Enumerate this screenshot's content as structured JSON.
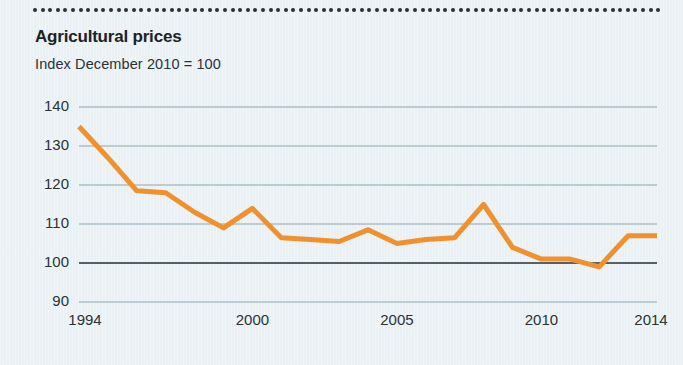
{
  "figure": {
    "title": "Agricultural prices",
    "subtitle": "Index December 2010 = 100",
    "background_color": "#e9f1f4",
    "accent_color": "#f0912d",
    "text_color": "#1c2226",
    "gridline_color": "#8fa3ad",
    "baseline_color": "#55626a",
    "rule_color": "#2a2f33"
  },
  "chart_data": {
    "type": "line",
    "title": "Agricultural prices",
    "subtitle": "Index December 2010 = 100",
    "xlabel": "",
    "ylabel": "",
    "xlim": [
      1994,
      2014
    ],
    "ylim": [
      90,
      140
    ],
    "yticks": [
      90,
      100,
      110,
      120,
      130,
      140
    ],
    "ytick_labels": [
      "90",
      "100",
      "110",
      "120",
      "130",
      "140"
    ],
    "xticks": [
      1994,
      2000,
      2005,
      2010,
      2014
    ],
    "xtick_labels": [
      "1994",
      "2000",
      "2005",
      "2010",
      "2014"
    ],
    "grid": true,
    "grid_axis": "y",
    "baseline_value": 100,
    "legend": null,
    "legend_position": "none",
    "series": [
      {
        "name": "Agricultural price index",
        "color": "#f0912d",
        "line_width": 5,
        "x": [
          1994,
          1995,
          1996,
          1997,
          1998,
          1999,
          2000,
          2001,
          2002,
          2003,
          2004,
          2005,
          2006,
          2007,
          2008,
          2009,
          2010,
          2011,
          2012,
          2013,
          2014
        ],
        "values": [
          135.0,
          127.0,
          118.5,
          118.0,
          113.0,
          109.0,
          114.0,
          106.5,
          106.0,
          105.5,
          108.5,
          105.0,
          106.0,
          106.5,
          115.0,
          104.0,
          101.0,
          101.0,
          99.0,
          107.0,
          107.0
        ]
      }
    ]
  }
}
